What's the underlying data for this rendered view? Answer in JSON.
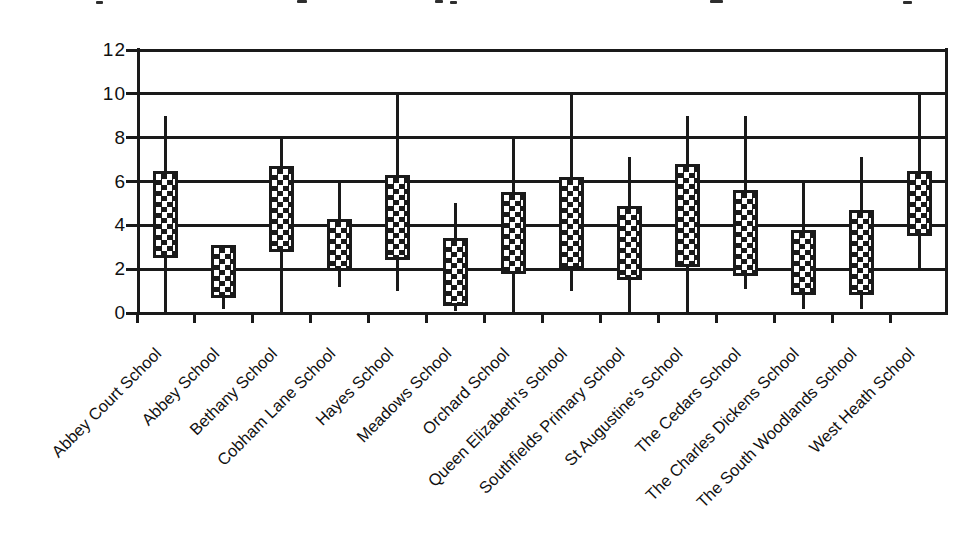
{
  "page": {
    "background": "#ffffff",
    "ink_color": "#1a1a1a"
  },
  "chart_data": {
    "type": "bar",
    "subtype": "floating-box-with-high-low-whiskers",
    "title": "",
    "xlabel": "",
    "ylabel": "",
    "ylim": [
      0,
      12
    ],
    "yticks": [
      0,
      2,
      4,
      6,
      8,
      10,
      12
    ],
    "ytick_labels": [
      "0",
      "2",
      "4",
      "6",
      "8",
      "10",
      "12"
    ],
    "grid": true,
    "legend": false,
    "box_fill": "black-white checkerboard",
    "categories": [
      "Abbey Court School",
      "Abbey School",
      "Bethany School",
      "Cobham Lane School",
      "Hayes School",
      "Meadows School",
      "Orchard School",
      "Queen Elizabeth's School",
      "Southfields Primary School",
      "St Augustine's School",
      "The Cedars School",
      "The Charles Dickens School",
      "The South Woodlands School",
      "West Heath School"
    ],
    "series": [
      {
        "name": "whisker_low",
        "values": [
          0,
          0.2,
          0,
          1.2,
          1,
          0.1,
          0,
          1,
          0,
          0,
          1.1,
          0.2,
          0.2,
          2
        ]
      },
      {
        "name": "box_low",
        "values": [
          2.5,
          0.7,
          2.8,
          1.9,
          2.4,
          0.3,
          1.8,
          2.0,
          1.5,
          2.1,
          1.7,
          0.8,
          0.8,
          3.5
        ]
      },
      {
        "name": "box_high",
        "values": [
          6.5,
          3.1,
          6.7,
          4.3,
          6.3,
          3.4,
          5.5,
          6.2,
          4.9,
          6.8,
          5.6,
          3.8,
          4.7,
          6.5
        ]
      },
      {
        "name": "whisker_high",
        "values": [
          9,
          3.1,
          8,
          6,
          10,
          5,
          8,
          10,
          7.1,
          9,
          9,
          6,
          7.1,
          10
        ]
      }
    ]
  }
}
